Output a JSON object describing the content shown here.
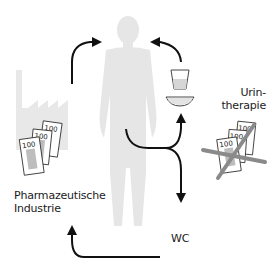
{
  "labels": {
    "urin_line1": "Urin-",
    "urin_line2": "therapie",
    "pharma_line1": "Pharmazeutische",
    "pharma_line2": "Industrie",
    "wc": "WC"
  },
  "banknotes": {
    "denomination": "100"
  },
  "colors": {
    "silhouette": "#e6e6e6",
    "factory": "#e8e8e8",
    "arrow": "#111111",
    "note_fill": "#ffffff",
    "note_stripe": "#bdbdbd",
    "strike": "#8a8a8a",
    "text": "#1a1a1a"
  },
  "icons": [
    "human-silhouette-icon",
    "factory-icon",
    "banknotes-icon",
    "cup-icon",
    "bowl-icon",
    "crossed-banknotes-icon",
    "arrow-icon"
  ]
}
